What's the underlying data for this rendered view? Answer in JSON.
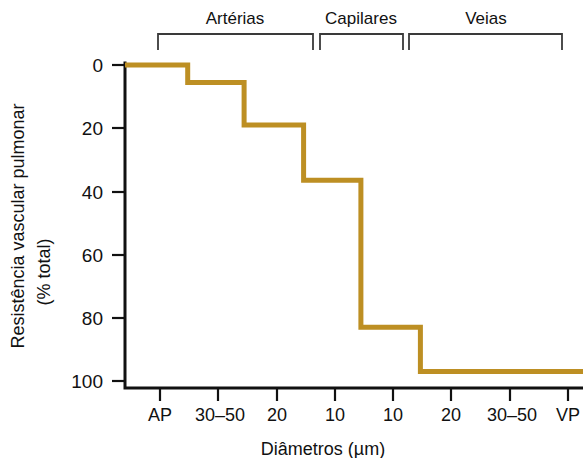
{
  "chart_data": {
    "type": "line",
    "subtype": "step",
    "title": "",
    "xlabel": "Diâmetros (µm)",
    "ylabel": "Resistência vascular pulmonar\n(% total)",
    "ylabel_line1": "Resistência vascular pulmonar",
    "ylabel_line2": "(% total)",
    "ylim": [
      0,
      100
    ],
    "y_inverted": true,
    "yticks": [
      0,
      20,
      40,
      60,
      80,
      100
    ],
    "ytick_labels": [
      "0",
      "20",
      "40",
      "60",
      "80",
      "100"
    ],
    "xtick_labels": [
      "AP",
      "30–50",
      "20",
      "10",
      "10",
      "20",
      "30–50",
      "VP"
    ],
    "grid": false,
    "legend": false,
    "line_color": "#bd8f23",
    "axis_color": "#111111",
    "categories": [
      "AP",
      "30–50",
      "20",
      "10",
      "10",
      "20",
      "30–50",
      "VP"
    ],
    "values": [
      0,
      5.5,
      19,
      36.5,
      83,
      97,
      97,
      97
    ],
    "step_segments": [
      {
        "label": "AP",
        "x_start_pct": 0,
        "x_end_pct": 13.7,
        "value": 0
      },
      {
        "label": "30–50",
        "x_start_pct": 13.7,
        "x_end_pct": 26.0,
        "value": 5.5
      },
      {
        "label": "20",
        "x_start_pct": 26.0,
        "x_end_pct": 39.0,
        "value": 19
      },
      {
        "label": "10",
        "x_start_pct": 39.0,
        "x_end_pct": 51.5,
        "value": 36.5
      },
      {
        "label": "10",
        "x_start_pct": 51.5,
        "x_end_pct": 64.5,
        "value": 83
      },
      {
        "label": "20-VP",
        "x_start_pct": 64.5,
        "x_end_pct": 100,
        "value": 97
      }
    ],
    "groups": [
      {
        "name": "Artérias",
        "span_labels": [
          "AP",
          "30–50",
          "20",
          "10"
        ]
      },
      {
        "name": "Capilares",
        "span_labels": [
          "10"
        ]
      },
      {
        "name": "Veias",
        "span_labels": [
          "20",
          "30–50",
          "VP"
        ]
      }
    ]
  },
  "brackets": {
    "arterias": "Artérias",
    "capilares": "Capilares",
    "veias": "Veias"
  },
  "axes": {
    "y_title_line1": "Resistência vascular pulmonar",
    "y_title_line2": "(% total)",
    "x_title": "Diâmetros (µm)",
    "y_tick_0": "0",
    "y_tick_20": "20",
    "y_tick_40": "40",
    "y_tick_60": "60",
    "y_tick_80": "80",
    "y_tick_100": "100",
    "x_tick_1": "AP",
    "x_tick_2": "30–50",
    "x_tick_3": "20",
    "x_tick_4": "10",
    "x_tick_5": "10",
    "x_tick_6": "20",
    "x_tick_7": "30–50",
    "x_tick_8": "VP"
  }
}
